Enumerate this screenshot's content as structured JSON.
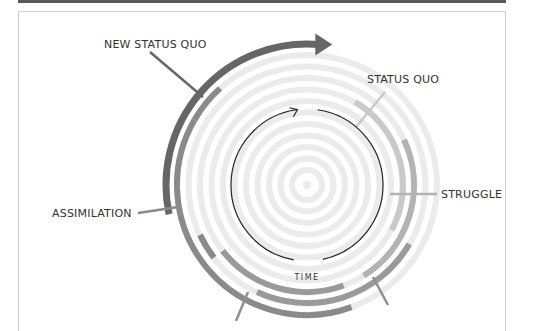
{
  "diagram": {
    "center_label": "TIME",
    "labels": {
      "new_status_quo": "NEW STATUS QUO",
      "status_quo": "STATUS QUO",
      "struggle": "STRUGGLE",
      "assimilation": "ASSIMILATION"
    },
    "colors": {
      "ring_light": "#ebebeb",
      "status_quo": "#c9c9c9",
      "struggle": "#b3b3b3",
      "chaos": "#9a9a9a",
      "assimilation": "#8a8a8a",
      "new_status_quo": "#666666",
      "leader": "#8f8f8f",
      "time_arrow": "#222222",
      "topbar": "#5a5a5a",
      "frame": "#cfcfcf"
    }
  }
}
